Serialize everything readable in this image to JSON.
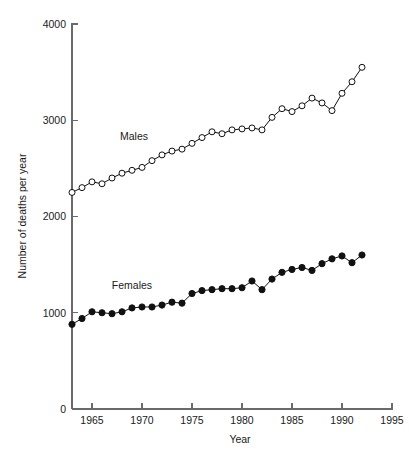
{
  "chart_data": {
    "type": "line",
    "title": "",
    "subtitle": "",
    "xlabel": "Year",
    "ylabel": "Number of deaths per year",
    "xlim": [
      1963,
      1995
    ],
    "ylim": [
      0,
      4000
    ],
    "grid": false,
    "legend_position": "inline-annotation",
    "x_ticks": [
      1965,
      1970,
      1975,
      1980,
      1985,
      1990,
      1995
    ],
    "x_tick_labels": [
      "1965",
      "1970",
      "1975",
      "1980",
      "1985",
      "1990",
      "1995"
    ],
    "y_ticks": [
      0,
      1000,
      2000,
      3000,
      4000
    ],
    "y_tick_labels": [
      "0",
      "1000",
      "2000",
      "3000",
      "4000"
    ],
    "x": [
      1963,
      1964,
      1965,
      1966,
      1967,
      1968,
      1969,
      1970,
      1971,
      1972,
      1973,
      1974,
      1975,
      1976,
      1977,
      1978,
      1979,
      1980,
      1981,
      1982,
      1983,
      1984,
      1985,
      1986,
      1987,
      1988,
      1989,
      1990,
      1991,
      1992
    ],
    "series": [
      {
        "name": "Males",
        "marker": "open-circle",
        "label_x": 1969.2,
        "label_y": 2790,
        "values": [
          2250,
          2300,
          2360,
          2340,
          2400,
          2450,
          2480,
          2510,
          2580,
          2640,
          2680,
          2700,
          2760,
          2820,
          2880,
          2860,
          2900,
          2910,
          2920,
          2900,
          3030,
          3120,
          3090,
          3150,
          3230,
          3180,
          3100,
          3280,
          3400,
          3550
        ]
      },
      {
        "name": "Females",
        "marker": "filled-circle",
        "label_x": 1969.0,
        "label_y": 1250,
        "values": [
          880,
          940,
          1010,
          1000,
          990,
          1010,
          1050,
          1060,
          1060,
          1080,
          1110,
          1100,
          1200,
          1230,
          1240,
          1250,
          1250,
          1260,
          1330,
          1240,
          1350,
          1420,
          1450,
          1470,
          1440,
          1510,
          1560,
          1590,
          1520,
          1600
        ]
      }
    ],
    "annotations": [
      {
        "text": "Males",
        "x": 1969.2,
        "y": 2790
      },
      {
        "text": "Females",
        "x": 1969.0,
        "y": 1250
      }
    ]
  }
}
